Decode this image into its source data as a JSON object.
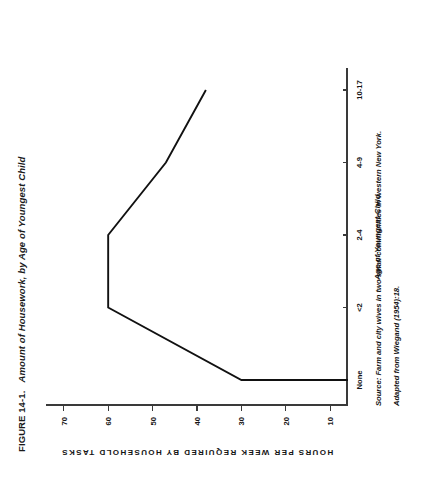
{
  "figure": {
    "number": "FIGURE 14-1.",
    "title": "Amount of Housework, by Age of Youngest Child"
  },
  "notes": {
    "source": "Source: Farm and city wives in two small communities in western New York.",
    "adapted": "Adapted from Wiegand (1954):18."
  },
  "chart_data": {
    "type": "line",
    "title": "Amount of Housework, by Age of Youngest Child",
    "xlabel": "Age of Youngest Child",
    "ylabel": "HOURS PER WEEK REQUIRED BY HOUSEHOLD TASKS",
    "categories": [
      "None",
      "<2",
      "2-4",
      "4-9",
      "10-17"
    ],
    "values": [
      30,
      60,
      60,
      47,
      38
    ],
    "xticklabels": [
      "None",
      "<2",
      "2-4",
      "4-9",
      "10-17"
    ],
    "yticklabels": [
      "10",
      "20",
      "30",
      "40",
      "50",
      "60",
      "70"
    ],
    "ytickvalues": [
      10,
      20,
      30,
      40,
      50,
      60,
      70
    ],
    "ylim": [
      6,
      74
    ],
    "grid": false,
    "legend": false,
    "line_color": "#111111"
  }
}
